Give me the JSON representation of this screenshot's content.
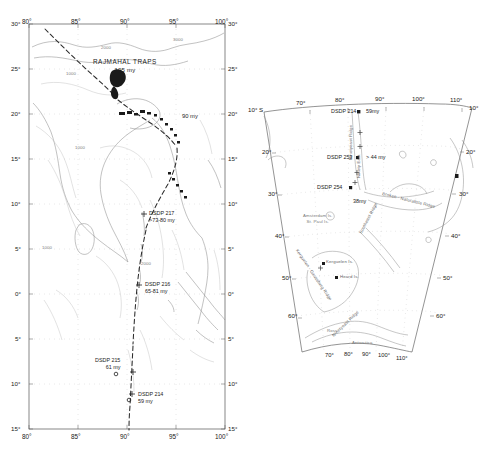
{
  "figure": {
    "domain_note": "two-panel geologic/oceanographic map figure",
    "panels": [
      "left-bay-of-bengal-map",
      "right-indian-ocean-map"
    ]
  },
  "left_map": {
    "name": "Bay of Bengal / Ninetyeast Ridge map",
    "lon_ticks_top": [
      "80°",
      "85°",
      "90°",
      "95°",
      "100°"
    ],
    "lon_ticks_bottom": [
      "80°",
      "85°",
      "90°",
      "95°",
      "100°"
    ],
    "lat_ticks_left": [
      "30°",
      "25°",
      "20°",
      "15°",
      "10°",
      "5°",
      "0°",
      "5°",
      "10°",
      "15°"
    ],
    "lat_ticks_right": [
      "30°",
      "25°",
      "20°",
      "15°",
      "10°",
      "5°",
      "0°",
      "5°",
      "10°",
      "15°"
    ],
    "annotations": {
      "rajmahal_title": "RAJMAHAL TRAPS",
      "rajmahal_age": "105 my",
      "age_90": "90 my"
    },
    "sites": [
      {
        "id": "dsdp-217",
        "label": "DSDP 217",
        "age": ">73-80 my"
      },
      {
        "id": "dsdp-216",
        "label": "DSDP 216",
        "age": "65-81 my"
      },
      {
        "id": "dsdp-215",
        "label": "DSDP 215",
        "age": "61 my"
      },
      {
        "id": "dsdp-214",
        "label": "DSDP 214",
        "age": "59 my"
      }
    ],
    "bathymetry_labels": [
      "1000",
      "2000",
      "3000",
      "1000",
      "2000",
      "1000"
    ]
  },
  "right_map": {
    "name": "Southern Indian Ocean / Kerguelen map",
    "lat_top_left": "10° S",
    "lat_ticks_left": [
      "20°",
      "30°",
      "40°",
      "50°",
      "60°"
    ],
    "lat_ticks_right": [
      "10°",
      "20°",
      "30°",
      "40°",
      "50°",
      "60°"
    ],
    "lon_ticks_top": [
      "70°",
      "80°",
      "90°",
      "100°",
      "110°"
    ],
    "lon_ticks_bottom": [
      "70°",
      "80°",
      "90°",
      "100°",
      "110°"
    ],
    "sites": [
      {
        "id": "dsdp-214",
        "label": "DSDP 214",
        "age": "59my"
      },
      {
        "id": "dsdp-253",
        "label": "DSDP 253",
        "age": "> 44 my"
      },
      {
        "id": "dsdp-254",
        "label": "DSDP 254",
        "age": "38my"
      }
    ],
    "features": [
      {
        "id": "ninetyeast-ridge",
        "label": "Ninetyeast Ridge"
      },
      {
        "id": "broken-naturaliste-ridge",
        "label": "Broken - Naturaliste Ridge"
      },
      {
        "id": "southeast-ridge",
        "label": "Southeast Ridge"
      },
      {
        "id": "ninetyeast-ridge-south",
        "label": "Ninetyeast Ridge"
      },
      {
        "id": "kerguelen-gaussberg-ridge",
        "label": "Kerguelen - Gaussberg Ridge"
      },
      {
        "id": "amsterdam-st-paul",
        "label": "Amsterdam Is.\nSt. Paul Is."
      },
      {
        "id": "kerguelen-island",
        "label": "Kerguelen Is."
      },
      {
        "id": "heard-island",
        "label": "Heard Is."
      },
      {
        "id": "ross-sea",
        "label": "Ross"
      },
      {
        "id": "antarctica",
        "label": "Antarctica"
      },
      {
        "id": "ninety-east",
        "label": "Ninety East"
      }
    ]
  },
  "colors": {
    "ink": "#1a1a1a",
    "coastline": "#8a8a8a",
    "bathymetry": "#b0b0b0",
    "track": "#2b2b2b",
    "frame": "#555555"
  }
}
